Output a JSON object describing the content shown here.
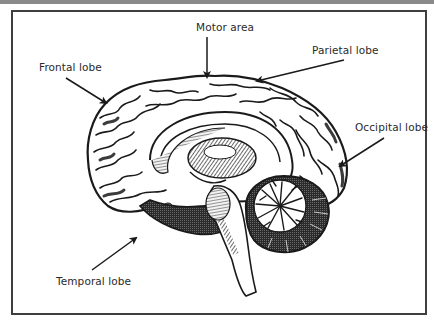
{
  "diagram": {
    "colors": {
      "frame_border": "#3f3f3f",
      "top_bar": "#8a8a8a",
      "ink": "#1a1a1a",
      "label_text": "#2a2a2a",
      "background": "#ffffff"
    },
    "labels": [
      {
        "id": "motor-area",
        "text": "Motor area",
        "x": 196,
        "y": 21,
        "arrow": {
          "from": [
            207,
            37
          ],
          "to": [
            207,
            77
          ]
        }
      },
      {
        "id": "frontal-lobe",
        "text": "Frontal lobe",
        "x": 39,
        "y": 61,
        "arrow": {
          "from": [
            66,
            78
          ],
          "to": [
            106,
            103
          ]
        }
      },
      {
        "id": "parietal-lobe",
        "text": "Parietal lobe",
        "x": 312,
        "y": 44,
        "arrow": {
          "from": [
            344,
            60
          ],
          "to": [
            257,
            81
          ]
        }
      },
      {
        "id": "occipital-lobe",
        "text": "Occipital lobe",
        "x": 355,
        "y": 121,
        "arrow": {
          "from": [
            384,
            138
          ],
          "to": [
            340,
            166
          ]
        }
      },
      {
        "id": "temporal-lobe",
        "text": "Temporal lobe",
        "x": 56,
        "y": 275,
        "arrow": {
          "from": [
            92,
            270
          ],
          "to": [
            136,
            238
          ]
        }
      }
    ]
  }
}
